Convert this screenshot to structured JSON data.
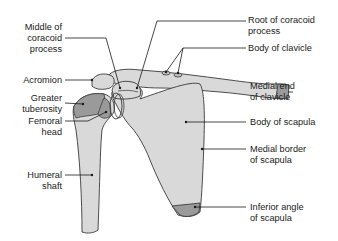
{
  "figure": {
    "colors": {
      "bone_fill": "#d9d9d9",
      "articular_fill": "#9a9a9a",
      "outline": "#3a3a3a",
      "leader_line": "#1a1a1a",
      "background": "#ffffff"
    },
    "labels_left": [
      {
        "id": "middle-coracoid",
        "line1": "Middle of",
        "line2": "coracoid",
        "line3": "process"
      },
      {
        "id": "acromion",
        "line1": "Acromion"
      },
      {
        "id": "greater-tuberosity",
        "line1": "Greater",
        "line2": "tuberosity"
      },
      {
        "id": "femoral-head",
        "line1": "Femoral",
        "line2": "head"
      },
      {
        "id": "humeral-shaft",
        "line1": "Humeral",
        "line2": "shaft"
      }
    ],
    "labels_right": [
      {
        "id": "root-coracoid",
        "line1": "Root of coracoid",
        "line2": "process"
      },
      {
        "id": "body-clavicle",
        "line1": "Body of clavicle"
      },
      {
        "id": "medial-end-clavicle",
        "line1": "Medial end",
        "line2": "of clavicle"
      },
      {
        "id": "body-scapula",
        "line1": "Body of scapula"
      },
      {
        "id": "medial-border-scapula",
        "line1": "Medial border",
        "line2": "of scapula"
      },
      {
        "id": "inferior-angle-scapula",
        "line1": "Inferior angle",
        "line2": "of scapula"
      }
    ]
  }
}
